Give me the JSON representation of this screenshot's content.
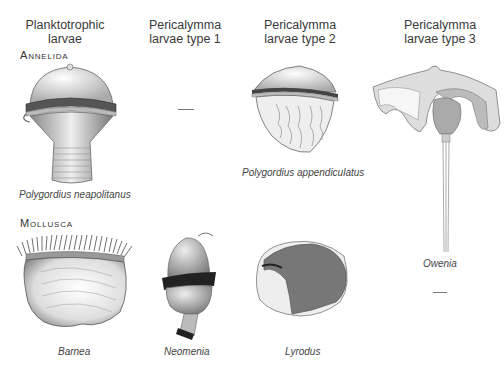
{
  "columns": [
    {
      "line1": "Planktotrophic",
      "line2": "larvae"
    },
    {
      "line1": "Pericalymma",
      "line2": "larvae type 1"
    },
    {
      "line1": "Pericalymma",
      "line2": "larvae type 2"
    },
    {
      "line1": "Pericalymma",
      "line2": "larvae type 3"
    }
  ],
  "rows": [
    {
      "label": "Annelida"
    },
    {
      "label": "Mollusca"
    }
  ],
  "specimens": {
    "polygordius_neapolitanus": "Polygordius neapolitanus",
    "polygordius_appendiculatus": "Polygordius appendiculatus",
    "owenia": "Owenia",
    "barnea": "Barnea",
    "neomenia": "Neomenia",
    "lyrodus": "Lyrodus"
  }
}
